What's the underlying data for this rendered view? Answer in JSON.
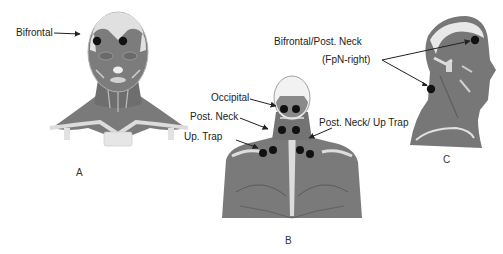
{
  "figure": {
    "panels": [
      {
        "id": "A",
        "caption": "A",
        "view": "anterior head and neck"
      },
      {
        "id": "B",
        "caption": "B",
        "view": "posterior head, neck and upper back"
      },
      {
        "id": "C",
        "caption": "C",
        "view": "right lateral head and neck"
      }
    ],
    "labels": {
      "bifrontal": "Bifrontal",
      "occipital": "Occipital",
      "post_neck": "Post. Neck",
      "up_trap": "Up. Trap",
      "post_neck_up_trap": "Post. Neck/ Up Trap",
      "bifrontal_post_neck": "Bifrontal/Post. Neck",
      "fpn_right": "(FpN-right)"
    },
    "colors": {
      "muscle": "#7a7a7a",
      "muscle_dark": "#5e5e5e",
      "bone": "#e4e4e4",
      "outline": "#9a9a9a",
      "marker": "#111111",
      "arrow": "#222222",
      "text": "#222222"
    }
  }
}
